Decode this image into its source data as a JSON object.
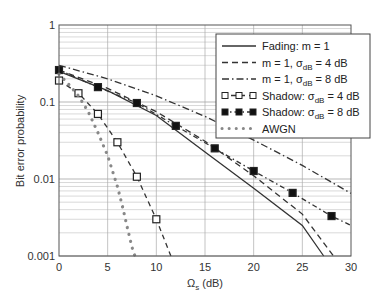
{
  "chart_data": {
    "type": "line",
    "title": "",
    "xlabel": "Ω_s (dB)",
    "ylabel": "Bit error probability",
    "xlim": [
      0,
      30
    ],
    "ylim": [
      0.001,
      1
    ],
    "yscale": "log",
    "grid": true,
    "legend_position": "upper right",
    "xticks": [
      "0",
      "5",
      "10",
      "15",
      "20",
      "25",
      "30"
    ],
    "yticks": [
      "0.001",
      "0.01",
      "0.1",
      "1"
    ],
    "series": [
      {
        "name": "Fading: m = 1",
        "style": "solid",
        "x": [
          0,
          5,
          10,
          15,
          20,
          25,
          27.2
        ],
        "y": [
          0.25,
          0.14,
          0.0667,
          0.0225,
          0.0076,
          0.0025,
          0.001
        ]
      },
      {
        "name": "m = 1, σdB = 4 dB",
        "style": "dashed",
        "x": [
          0,
          5,
          10,
          15,
          20,
          25,
          28.2
        ],
        "y": [
          0.26,
          0.15,
          0.075,
          0.031,
          0.011,
          0.0035,
          0.001
        ]
      },
      {
        "name": "m = 1, σdB = 8 dB",
        "style": "dashdot",
        "x": [
          0,
          5,
          10,
          15,
          20,
          25,
          30
        ],
        "y": [
          0.3,
          0.2,
          0.12,
          0.065,
          0.032,
          0.015,
          0.0065
        ]
      },
      {
        "name": "Shadow: σdB = 4 dB",
        "style": "dashed-open-square",
        "x": [
          0,
          2,
          4,
          6,
          8,
          10,
          11.5
        ],
        "y": [
          0.19,
          0.13,
          0.07,
          0.03,
          0.0107,
          0.003,
          0.001
        ],
        "markers_x": [
          0,
          2,
          4,
          6,
          8,
          10
        ],
        "markers_y": [
          0.19,
          0.13,
          0.07,
          0.03,
          0.0107,
          0.003
        ]
      },
      {
        "name": "Shadow: σdB = 8 dB",
        "style": "dashdot-filled-square",
        "x": [
          0,
          4,
          8,
          12,
          16,
          20,
          24,
          28,
          30
        ],
        "y": [
          0.26,
          0.156,
          0.097,
          0.049,
          0.025,
          0.0127,
          0.0066,
          0.0033,
          0.0025
        ],
        "markers_x": [
          0,
          4,
          8,
          12,
          16,
          20,
          24,
          28
        ],
        "markers_y": [
          0.26,
          0.156,
          0.097,
          0.049,
          0.025,
          0.0127,
          0.0066,
          0.0033
        ]
      },
      {
        "name": "AWGN",
        "style": "dotted",
        "x": [
          0,
          1,
          2,
          3,
          4,
          5,
          6,
          6.5,
          7,
          7.5,
          7.8
        ],
        "y": [
          0.23,
          0.17,
          0.12,
          0.075,
          0.04,
          0.02,
          0.008,
          0.0045,
          0.0024,
          0.0013,
          0.001
        ]
      }
    ]
  },
  "legend": {
    "items": [
      {
        "label": "Fading: m = 1"
      },
      {
        "label": "m = 1, σ",
        "sub": "dB",
        "tail": " = 4 dB"
      },
      {
        "label": "m = 1, σ",
        "sub": "dB",
        "tail": " = 8 dB"
      },
      {
        "label": "Shadow: σ",
        "sub": "dB",
        "tail": " = 4 dB"
      },
      {
        "label": "Shadow: σ",
        "sub": "dB",
        "tail": " = 8 dB"
      },
      {
        "label": "AWGN"
      }
    ]
  },
  "axes": {
    "xlabel_main": "Ω",
    "xlabel_sub": "s",
    "xlabel_tail": " (dB)",
    "ylabel": "Bit error probability"
  },
  "colors": {
    "line": "#333333",
    "awgn": "#888888",
    "grid": "#c8c8c8",
    "axis": "#555555"
  }
}
